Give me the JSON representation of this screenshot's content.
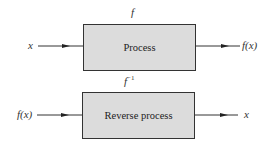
{
  "diagram": {
    "top": {
      "function_label": "f",
      "box_label": "Process",
      "input": "x",
      "output": "f(x)"
    },
    "bottom": {
      "function_label": "f",
      "function_superscript": "−1",
      "box_label": "Reverse process",
      "input": "f(x)",
      "output": "x"
    },
    "colors": {
      "box_fill": "#dcdcdc",
      "stroke": "#333333"
    }
  }
}
